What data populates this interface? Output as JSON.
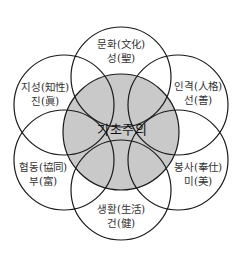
{
  "colors": {
    "center_fill": "#c9c9c9",
    "stroke": "#1a1a1a"
  },
  "center": {
    "label": "기초주의"
  },
  "petals": [
    {
      "id": "top",
      "line1": "문화(文化)",
      "line2": "성(聖)"
    },
    {
      "id": "top-right",
      "line1": "인격(人格)",
      "line2": "선(善)"
    },
    {
      "id": "bottom-right",
      "line1": "봉사(奉仕)",
      "line2": "미(美)"
    },
    {
      "id": "bottom",
      "line1": "생활(生活)",
      "line2": "건(健)"
    },
    {
      "id": "bottom-left",
      "line1": "협동(協同)",
      "line2": "부(富)"
    },
    {
      "id": "top-left",
      "line1": "지성(知性)",
      "line2": "진(眞)"
    }
  ]
}
